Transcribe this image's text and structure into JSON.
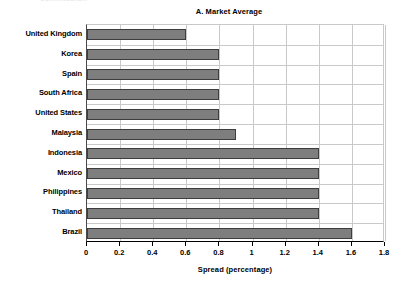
{
  "figure": {
    "clipped_header_fragment": "commission",
    "title": "A. Market Average"
  },
  "axis": {
    "xlabel": "Spread (percentage)",
    "xticks": [
      "0",
      "0.2",
      "0.4",
      "0.6",
      "0.8",
      "1",
      "1.2",
      "1.4",
      "1.6",
      "1.8"
    ]
  },
  "colors": {
    "bar_fill": "#7e7e7e",
    "bar_edge": "#3d3d3d",
    "grid": "#c9c9c9",
    "axis": "#000000",
    "background": "#ffffff"
  },
  "chart_data": {
    "type": "bar",
    "orientation": "horizontal",
    "title": "A. Market Average",
    "xlabel": "Spread (percentage)",
    "ylabel": "",
    "xlim": [
      0,
      1.8
    ],
    "xtick_step": 0.2,
    "grid": true,
    "legend": false,
    "categories": [
      "United Kingdom",
      "Korea",
      "Spain",
      "South Africa",
      "United States",
      "Malaysia",
      "Indonesia",
      "Mexico",
      "Philippines",
      "Thailand",
      "Brazil"
    ],
    "values": [
      0.6,
      0.8,
      0.8,
      0.8,
      0.8,
      0.9,
      1.4,
      1.4,
      1.4,
      1.4,
      1.6
    ],
    "series": [
      {
        "name": "Market Average",
        "values": [
          0.6,
          0.8,
          0.8,
          0.8,
          0.8,
          0.9,
          1.4,
          1.4,
          1.4,
          1.4,
          1.6
        ]
      }
    ]
  }
}
